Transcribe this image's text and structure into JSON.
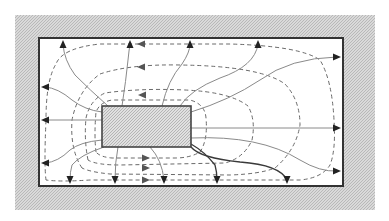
{
  "diagram": {
    "type": "field-flow-diagram",
    "colors": {
      "background": "#ffffff",
      "hatch": "#c8c8c8",
      "frame_border": "#333333",
      "flow_line": "#8a8a8a",
      "equipotential_line": "#6a6a6a",
      "arrowhead": "#222222"
    },
    "outer_region": {
      "x": 15,
      "y": 15,
      "w": 360,
      "h": 195,
      "fill": "hatched"
    },
    "frame": {
      "x": 39,
      "y": 38,
      "w": 304,
      "h": 148
    },
    "inner_box": {
      "x": 102,
      "y": 106,
      "w": 89,
      "h": 41,
      "fill": "hatched"
    },
    "flow_line_count": 16,
    "equipotential_loop_count": 4,
    "arrow_exits": {
      "top": [
        63,
        130,
        190,
        258
      ],
      "right": [
        57,
        128,
        171
      ],
      "left": [
        87,
        120,
        163
      ],
      "bottom": [
        70,
        115,
        164,
        217,
        287
      ]
    }
  }
}
